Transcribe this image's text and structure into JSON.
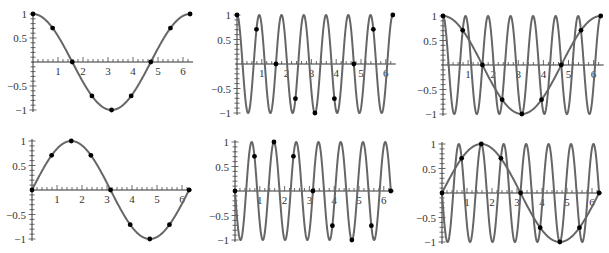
{
  "figure": {
    "colors": {
      "curve": "#666666",
      "axis": "#333333",
      "dot": "#000000",
      "background": "#ffffff"
    }
  },
  "chart_data": [
    {
      "type": "line",
      "panel": "top-left",
      "title": "",
      "series": [
        {
          "name": "cos(x)",
          "function": "cos",
          "frequency": 1
        }
      ],
      "samples": {
        "function": "cos",
        "frequency": 1,
        "x": [
          0,
          0.785,
          1.571,
          2.356,
          3.142,
          3.927,
          4.712,
          5.498,
          6.283
        ],
        "y": [
          1,
          0.707,
          0,
          -0.707,
          -1,
          -0.707,
          0,
          0.707,
          1
        ]
      },
      "xlim": [
        0,
        6.283
      ],
      "ylim": [
        -1,
        1
      ],
      "xticks": [
        "1",
        "2",
        "3",
        "4",
        "5",
        "6"
      ],
      "yticks": [
        "1",
        "0.5",
        "−0.5",
        "−1"
      ],
      "xlabel": "",
      "ylabel": "",
      "grid": false,
      "legend": "none",
      "geom": {
        "ox": 33,
        "oy": 62,
        "sx": 25.0,
        "sy": 48
      }
    },
    {
      "type": "line",
      "panel": "top-middle",
      "title": "",
      "series": [
        {
          "name": "cos(7x)",
          "function": "cos",
          "frequency": 7
        }
      ],
      "samples": {
        "function": "cos",
        "frequency": 1,
        "x": [
          0,
          0.785,
          1.571,
          2.356,
          3.142,
          3.927,
          4.712,
          5.498,
          6.283
        ],
        "y": [
          1,
          0.707,
          0,
          -0.707,
          -1,
          -0.707,
          0,
          0.707,
          1
        ]
      },
      "xlim": [
        0,
        6.283
      ],
      "ylim": [
        -1,
        1
      ],
      "xticks": [
        "1",
        "2",
        "3",
        "4",
        "5",
        "6"
      ],
      "yticks": [
        "1",
        "0.5",
        "−0.5",
        "−1"
      ],
      "xlabel": "",
      "ylabel": "",
      "grid": false,
      "legend": "none",
      "geom": {
        "ox": 237,
        "oy": 64,
        "sx": 24.8,
        "sy": 49
      }
    },
    {
      "type": "line",
      "panel": "top-right",
      "title": "",
      "series": [
        {
          "name": "cos(x)",
          "function": "cos",
          "frequency": 1
        },
        {
          "name": "cos(7x)",
          "function": "cos",
          "frequency": 7
        }
      ],
      "samples": {
        "function": "cos",
        "frequency": 1,
        "x": [
          0,
          0.785,
          1.571,
          2.356,
          3.142,
          3.927,
          4.712,
          5.498,
          6.283
        ],
        "y": [
          1,
          0.707,
          0,
          -0.707,
          -1,
          -0.707,
          0,
          0.707,
          1
        ]
      },
      "xlim": [
        0,
        6.283
      ],
      "ylim": [
        -1,
        1
      ],
      "xticks": [
        "1",
        "2",
        "3",
        "4",
        "5",
        "6"
      ],
      "yticks": [
        "1",
        "0.5",
        "−0.5",
        "−1"
      ],
      "xlabel": "",
      "ylabel": "",
      "grid": false,
      "legend": "none",
      "geom": {
        "ox": 443,
        "oy": 65,
        "sx": 25.1,
        "sy": 49
      }
    },
    {
      "type": "line",
      "panel": "bottom-left",
      "title": "",
      "series": [
        {
          "name": "sin(x)",
          "function": "sin",
          "frequency": 1
        }
      ],
      "samples": {
        "function": "sin",
        "frequency": 1,
        "x": [
          0,
          0.785,
          1.571,
          2.356,
          3.142,
          3.927,
          4.712,
          5.498,
          6.283
        ],
        "y": [
          0,
          0.707,
          1,
          0.707,
          0,
          -0.707,
          -1,
          -0.707,
          0
        ]
      },
      "xlim": [
        0,
        6.283
      ],
      "ylim": [
        -1,
        1
      ],
      "xticks": [
        "1",
        "2",
        "3",
        "4",
        "5",
        "6"
      ],
      "yticks": [
        "1",
        "0.5",
        "−0.5",
        "−1"
      ],
      "xlabel": "",
      "ylabel": "",
      "grid": false,
      "legend": "none",
      "geom": {
        "ox": 32,
        "oy": 190,
        "sx": 25.0,
        "sy": 49
      }
    },
    {
      "type": "line",
      "panel": "bottom-middle",
      "title": "",
      "series": [
        {
          "name": "-sin(7x)",
          "function": "-sin",
          "frequency": 7
        }
      ],
      "samples": {
        "function": "sin",
        "frequency": 1,
        "x": [
          0,
          0.785,
          1.571,
          2.356,
          3.142,
          3.927,
          4.712,
          5.498,
          6.283
        ],
        "y": [
          0,
          0.707,
          1,
          0.707,
          0,
          -0.707,
          -1,
          -0.707,
          0
        ]
      },
      "xlim": [
        0,
        6.283
      ],
      "ylim": [
        -1,
        1
      ],
      "xticks": [
        "1",
        "2",
        "3",
        "4",
        "5",
        "6"
      ],
      "yticks": [
        "1",
        "0.5",
        "−0.5",
        "−1"
      ],
      "xlabel": "",
      "ylabel": "",
      "grid": false,
      "legend": "none",
      "geom": {
        "ox": 235,
        "oy": 191,
        "sx": 24.8,
        "sy": 49
      }
    },
    {
      "type": "line",
      "panel": "bottom-right",
      "title": "",
      "series": [
        {
          "name": "sin(x)",
          "function": "sin",
          "frequency": 1
        },
        {
          "name": "-sin(7x)",
          "function": "-sin",
          "frequency": 7
        }
      ],
      "samples": {
        "function": "sin",
        "frequency": 1,
        "x": [
          0,
          0.785,
          1.571,
          2.356,
          3.142,
          3.927,
          4.712,
          5.498,
          6.283
        ],
        "y": [
          0,
          0.707,
          1,
          0.707,
          0,
          -0.707,
          -1,
          -0.707,
          0
        ]
      },
      "xlim": [
        0,
        6.283
      ],
      "ylim": [
        -1,
        1
      ],
      "xticks": [
        "1",
        "2",
        "3",
        "4",
        "5",
        "6"
      ],
      "yticks": [
        "1",
        "0.5",
        "−0.5",
        "−1"
      ],
      "xlabel": "",
      "ylabel": "",
      "grid": false,
      "legend": "none",
      "geom": {
        "ox": 442,
        "oy": 193,
        "sx": 25.0,
        "sy": 49
      }
    }
  ]
}
